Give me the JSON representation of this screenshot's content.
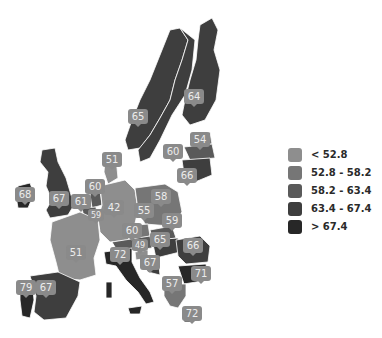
{
  "map": {
    "region": "Europe",
    "colors": {
      "lt_52_8": "#8e8e8e",
      "52_8_58_2": "#767676",
      "58_2_63_4": "#5a5a5a",
      "63_4_67_4": "#3e3e3e",
      "gt_67_4": "#272727",
      "marker": "#8a8a8a",
      "marker_text": "#ececec",
      "border": "#ffffff"
    },
    "markers": [
      {
        "country": "Ireland",
        "value": "68"
      },
      {
        "country": "United Kingdom",
        "value": "67"
      },
      {
        "country": "Belgium",
        "value": "61"
      },
      {
        "country": "Netherlands",
        "value": "60"
      },
      {
        "country": "Luxembourg",
        "value": "59"
      },
      {
        "country": "Denmark",
        "value": "51"
      },
      {
        "country": "Germany",
        "value": "42"
      },
      {
        "country": "France",
        "value": "51"
      },
      {
        "country": "Spain",
        "value": "67"
      },
      {
        "country": "Portugal",
        "value": "79"
      },
      {
        "country": "Sweden",
        "value": "65"
      },
      {
        "country": "Finland",
        "value": "64"
      },
      {
        "country": "Estonia",
        "value": "54"
      },
      {
        "country": "Latvia",
        "value": "60"
      },
      {
        "country": "Lithuania",
        "value": "66"
      },
      {
        "country": "Poland",
        "value": "58"
      },
      {
        "country": "Czech Republic",
        "value": "55"
      },
      {
        "country": "Slovakia",
        "value": "59"
      },
      {
        "country": "Austria",
        "value": "60"
      },
      {
        "country": "Hungary",
        "value": "65"
      },
      {
        "country": "Slovenia",
        "value": "49"
      },
      {
        "country": "Croatia",
        "value": "67"
      },
      {
        "country": "Italy",
        "value": "72"
      },
      {
        "country": "Romania",
        "value": "66"
      },
      {
        "country": "Bulgaria",
        "value": "71"
      },
      {
        "country": "Greece",
        "value": "57"
      },
      {
        "country": "Cyprus",
        "value": "72"
      }
    ]
  },
  "legend": {
    "items": [
      {
        "label": "< 52.8",
        "color": "#8e8e8e"
      },
      {
        "label": "52.8 - 58.2",
        "color": "#767676"
      },
      {
        "label": "58.2 - 63.4",
        "color": "#5a5a5a"
      },
      {
        "label": "63.4 - 67.4",
        "color": "#3e3e3e"
      },
      {
        "label": "> 67.4",
        "color": "#272727"
      }
    ]
  }
}
